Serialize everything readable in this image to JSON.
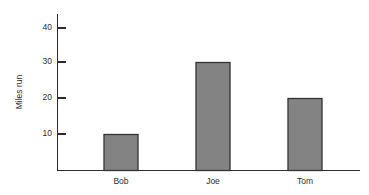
{
  "chart_data": {
    "type": "bar",
    "title": "",
    "subtitle": "",
    "xlabel": "",
    "ylabel": "Miles run",
    "categories": [
      "Bob",
      "Joe",
      "Tom"
    ],
    "values": [
      10,
      30,
      20
    ],
    "series": [
      {
        "name": "Miles run",
        "values": [
          10,
          30,
          20
        ]
      }
    ],
    "ylim": [
      0,
      44
    ],
    "yticks": [
      10,
      20,
      30,
      40
    ],
    "ytick_labels": [
      "10",
      "20",
      "30",
      "40"
    ],
    "grid": false,
    "legend": false,
    "legend_position": "none",
    "bar_fill_color": "#838383",
    "bar_edge_color": "#333333",
    "axis_color": "#2b2b2b",
    "background_color": "#ffffff"
  }
}
